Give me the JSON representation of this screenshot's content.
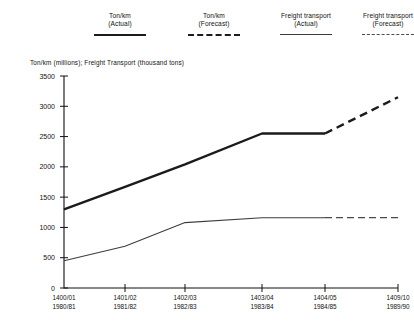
{
  "legend": {
    "items": [
      {
        "label": "Ton/km\n(Actual)",
        "style": "thick-solid",
        "name": "legend-tonkm-actual"
      },
      {
        "label": "Ton/km\n(Forecast)",
        "style": "thick-dash",
        "name": "legend-tonkm-forecast"
      },
      {
        "label": "Freight transport\n(Actual)",
        "style": "thin-solid",
        "name": "legend-freight-actual"
      },
      {
        "label": "Freight transport\n(Forecast)",
        "style": "thin-dash",
        "name": "legend-freight-forecast"
      }
    ]
  },
  "chart_data": {
    "type": "line",
    "title": "",
    "ylabel": "Ton/km (millions); Freight Transport (thousand tons)",
    "xlabel": "",
    "ylim": [
      0,
      3500
    ],
    "yticks": [
      0,
      500,
      1000,
      1500,
      2000,
      2500,
      3000,
      3500
    ],
    "ytick_labels": [
      "0",
      "500",
      "1000",
      "1500",
      "2000",
      "2500",
      "3000",
      "3500"
    ],
    "grid": false,
    "legend_position": "top",
    "categories": [
      "1400/01",
      "1401/02",
      "1402/03",
      "1403/04",
      "1404/05",
      "1409/10"
    ],
    "categories_secondary": [
      "1980/81",
      "1981/82",
      "1982/83",
      "1983/84",
      "1984/85",
      "1989/90"
    ],
    "forecast_start_index": 4,
    "series": [
      {
        "name": "Ton/km (Actual)",
        "style": "thick-solid",
        "values": [
          1300,
          1670,
          2040,
          2550,
          2550,
          null
        ]
      },
      {
        "name": "Ton/km (Forecast)",
        "style": "thick-dash",
        "values": [
          null,
          null,
          null,
          null,
          2550,
          3150
        ]
      },
      {
        "name": "Freight transport (Actual)",
        "style": "thin-solid",
        "values": [
          450,
          690,
          1080,
          1160,
          1160,
          null
        ]
      },
      {
        "name": "Freight transport (Forecast)",
        "style": "thin-dash",
        "values": [
          null,
          null,
          null,
          null,
          1160,
          1160
        ]
      }
    ]
  }
}
